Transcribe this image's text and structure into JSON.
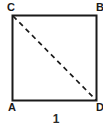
{
  "figure": {
    "caption": "1",
    "shape": "square",
    "stroke_color": "#1a1a1a",
    "fill_color": "#ffffff",
    "background_color": "#ffffff",
    "vertices": [
      {
        "id": "C",
        "label": "C",
        "position": "top-left"
      },
      {
        "id": "B",
        "label": "B",
        "position": "top-right"
      },
      {
        "id": "A",
        "label": "A",
        "position": "bottom-left"
      },
      {
        "id": "D",
        "label": "D",
        "position": "bottom-right"
      }
    ],
    "diagonal": {
      "from": "C",
      "to": "D",
      "style": "dashed",
      "color": "#1a1a1a"
    }
  }
}
